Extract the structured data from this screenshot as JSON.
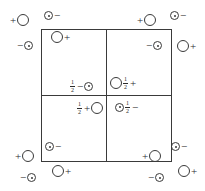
{
  "figure": {
    "line_color": "#3a3a3a",
    "text_color": "#2b2b2b",
    "background": "#ffffff"
  },
  "symbols": {
    "plus": "+",
    "minus": "−",
    "fraction_numerator": "1",
    "fraction_denominator": "2",
    "large_circle_name": "open-circle",
    "small_circle_name": "dotted-circle"
  },
  "lattice": {
    "square_label": "unit-cell-square",
    "quadrants": 4,
    "divider_vertical_label": "vertical-divider",
    "divider_horizontal_label": "horizontal-divider"
  },
  "charges": [
    {
      "id": "outer-top-left-plus",
      "sign": "+",
      "ion": "large",
      "order": "sign-first",
      "fraction": false,
      "x": 9,
      "y": 14
    },
    {
      "id": "outer-top-minus",
      "sign": "−",
      "ion": "small",
      "order": "ion-first",
      "fraction": false,
      "x": 44,
      "y": 10
    },
    {
      "id": "outer-left-minus",
      "sign": "−",
      "ion": "small",
      "order": "sign-first",
      "fraction": false,
      "x": 16,
      "y": 40
    },
    {
      "id": "inner-top-left-plus",
      "sign": "+",
      "ion": "large",
      "order": "ion-first",
      "fraction": false,
      "x": 51,
      "y": 31
    },
    {
      "id": "outer-top-right-plus",
      "sign": "+",
      "ion": "large",
      "order": "sign-first",
      "fraction": false,
      "x": 136,
      "y": 14
    },
    {
      "id": "outer-top-right-minus",
      "sign": "−",
      "ion": "small",
      "order": "ion-first",
      "fraction": false,
      "x": 170,
      "y": 10
    },
    {
      "id": "outer-right-plus",
      "sign": "+",
      "ion": "large",
      "order": "ion-first",
      "fraction": false,
      "x": 177,
      "y": 40
    },
    {
      "id": "inner-top-right-minus",
      "sign": "−",
      "ion": "small",
      "order": "sign-first",
      "fraction": false,
      "x": 145,
      "y": 40
    },
    {
      "id": "center-upper-left-half-minus",
      "sign": "−",
      "ion": "small",
      "order": "frac-sign-ion",
      "fraction": true,
      "x": 69,
      "y": 79
    },
    {
      "id": "center-upper-right-half-plus",
      "sign": "+",
      "ion": "large",
      "order": "ion-frac-sign",
      "fraction": true,
      "x": 110,
      "y": 76
    },
    {
      "id": "center-lower-left-half-plus",
      "sign": "+",
      "ion": "large",
      "order": "frac-sign-ion",
      "fraction": true,
      "x": 76,
      "y": 101
    },
    {
      "id": "center-lower-right-half-minus",
      "sign": "−",
      "ion": "small",
      "order": "ion-frac-sign",
      "fraction": true,
      "x": 115,
      "y": 100
    },
    {
      "id": "inner-bottom-left-minus",
      "sign": "−",
      "ion": "small",
      "order": "ion-first",
      "fraction": false,
      "x": 45,
      "y": 141
    },
    {
      "id": "outer-left-bottom-plus",
      "sign": "+",
      "ion": "large",
      "order": "sign-first",
      "fraction": false,
      "x": 14,
      "y": 150
    },
    {
      "id": "outer-bottom-left-plus",
      "sign": "+",
      "ion": "large",
      "order": "ion-first",
      "fraction": false,
      "x": 52,
      "y": 165
    },
    {
      "id": "outer-bottom-minus",
      "sign": "−",
      "ion": "small",
      "order": "sign-first",
      "fraction": false,
      "x": 19,
      "y": 172
    },
    {
      "id": "inner-bottom-right-minus",
      "sign": "−",
      "ion": "small",
      "order": "ion-first",
      "fraction": false,
      "x": 171,
      "y": 141
    },
    {
      "id": "outer-right-bottom-plus",
      "sign": "+",
      "ion": "large",
      "order": "sign-first",
      "fraction": false,
      "x": 141,
      "y": 150
    },
    {
      "id": "outer-bottom-right-plus",
      "sign": "+",
      "ion": "large",
      "order": "ion-first",
      "fraction": false,
      "x": 178,
      "y": 165
    },
    {
      "id": "outer-bottom-right-minus",
      "sign": "−",
      "ion": "small",
      "order": "sign-first",
      "fraction": false,
      "x": 147,
      "y": 172
    }
  ]
}
